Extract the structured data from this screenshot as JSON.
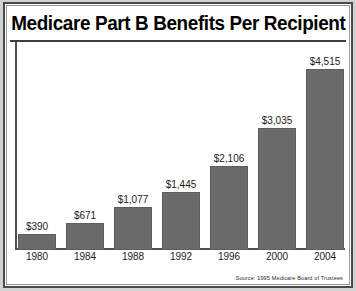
{
  "chart_data": {
    "type": "bar",
    "title": "Medicare Part B Benefits Per Recipient",
    "xlabel": "",
    "ylabel": "",
    "categories": [
      "1980",
      "1984",
      "1988",
      "1992",
      "1996",
      "2000",
      "2004"
    ],
    "values": [
      390,
      671,
      1077,
      1445,
      2106,
      3035,
      4515
    ],
    "value_labels": [
      "$390",
      "$671",
      "$1,077",
      "$1,445",
      "$2,106",
      "$3,035",
      "$4,515"
    ],
    "ylim": [
      0,
      4515
    ],
    "grid": false,
    "legend": null,
    "annotations": [
      "Source: 1995 Medicare Board of Trustees"
    ],
    "bar_color": "#6b6b6b",
    "background_color": "#ffffff",
    "axis_color": "#4f4f4f",
    "text_color": "#000000"
  },
  "source": {
    "text": "Source: 1995 Medicare Board of Trustees"
  }
}
